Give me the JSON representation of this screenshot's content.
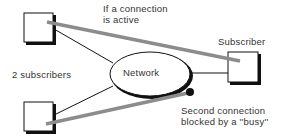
{
  "diagram": {
    "labels": {
      "active_connection": [
        "If a connection",
        "is active"
      ],
      "subscriber": "Subscriber",
      "two_subscribers": "2 subscribers",
      "network": "Network",
      "blocked": [
        "Second connection",
        "blocked by a ''busy''"
      ]
    },
    "nodes": [
      {
        "id": "subscriber-top-left",
        "shape": "square"
      },
      {
        "id": "subscriber-bottom-left",
        "shape": "square"
      },
      {
        "id": "subscriber-right",
        "shape": "square"
      },
      {
        "id": "network",
        "shape": "ellipse"
      }
    ],
    "edges": [
      {
        "from": "subscriber-top-left",
        "to": "network",
        "style": "thin-black"
      },
      {
        "from": "subscriber-bottom-left",
        "to": "network",
        "style": "thin-black"
      },
      {
        "from": "network",
        "to": "subscriber-right",
        "style": "thin-black"
      },
      {
        "from": "subscriber-top-left",
        "to": "subscriber-right",
        "style": "thick-gray",
        "meaning": "active connection"
      },
      {
        "from": "subscriber-bottom-left",
        "to": "blocked-dot",
        "style": "thick-gray",
        "meaning": "blocked connection"
      }
    ],
    "colors": {
      "connection_line": "#8c8c8c",
      "outline": "#111111",
      "text": "#333333"
    }
  }
}
